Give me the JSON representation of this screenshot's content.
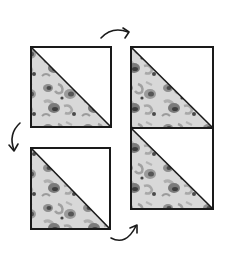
{
  "diagram": {
    "description": "Four half-square triangle quilt blocks arranged in a 2x2 layout with curved rotation arrows",
    "colors": {
      "background": "#ffffff",
      "outline": "#1a1a1a",
      "plain_half": "#ffffff",
      "print_base": "#d6d6d6",
      "print_mid": "#9a9a9a",
      "print_dark": "#4a4a4a"
    },
    "blocks": [
      {
        "id": "top-left",
        "x": 31,
        "y": 47,
        "w": 80,
        "h": 80,
        "print_half": "lower-left"
      },
      {
        "id": "top-right",
        "x": 131,
        "y": 47,
        "w": 82,
        "h": 81,
        "print_half": "lower-left"
      },
      {
        "id": "bottom-right",
        "x": 131,
        "y": 128,
        "w": 82,
        "h": 81,
        "print_half": "lower-left"
      },
      {
        "id": "bottom-left",
        "x": 31,
        "y": 148,
        "w": 79,
        "h": 81,
        "print_half": "lower-left"
      }
    ],
    "arrows": [
      {
        "id": "arrow-top",
        "direction": "clockwise-right",
        "from": "top-left",
        "to": "top-right"
      },
      {
        "id": "arrow-left",
        "direction": "down",
        "from": "top-left",
        "to": "bottom-left"
      },
      {
        "id": "arrow-bottom",
        "direction": "up-right",
        "from": "bottom-left",
        "to": "bottom-right"
      }
    ]
  }
}
